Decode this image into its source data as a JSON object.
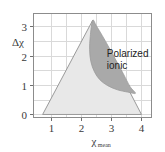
{
  "figure": {
    "background_color": "#ffffff",
    "plot_frame_color": "#8c8c8c",
    "grid_color": "#d9d9d9"
  },
  "chart_data": {
    "type": "area",
    "title": "",
    "subtitle": "",
    "xlabel": "χ",
    "xlabel_subscript": "mean",
    "ylabel": "Δχ",
    "xlim": [
      0.4,
      4.35
    ],
    "ylim": [
      -0.12,
      3.45
    ],
    "xticks": [
      1,
      2,
      3,
      4
    ],
    "xtick_labels": [
      "1",
      "2",
      "3",
      "4"
    ],
    "yticks": [
      0,
      1,
      2,
      3
    ],
    "ytick_labels": [
      "0",
      "1",
      "2",
      "3"
    ],
    "grid": true,
    "grid_x_values": [
      1,
      1.5,
      2,
      2.5,
      3,
      3.5,
      4
    ],
    "grid_y_values": [
      0,
      0.5,
      1,
      1.5,
      2,
      2.5,
      3
    ],
    "legend_position": "none",
    "regions": [
      {
        "name": "main-triangle",
        "label": "",
        "fill_color": "#e8e8e8",
        "edge_color": "#9a9a9a",
        "vertices": [
          [
            0.72,
            0.0
          ],
          [
            2.38,
            3.2
          ],
          [
            4.0,
            0.0
          ]
        ]
      },
      {
        "name": "polarized-ionic",
        "label": "Polarized ionic",
        "label_line1": "Polarized",
        "label_line2": "ionic",
        "label_x": 2.85,
        "label_y": 2.0,
        "fill_color": "#a9a9a9",
        "edge_color": "#9a9a9a",
        "outline_points": [
          [
            2.38,
            3.2
          ],
          [
            2.3,
            2.65
          ],
          [
            2.28,
            2.2
          ],
          [
            2.32,
            1.8
          ],
          [
            2.44,
            1.45
          ],
          [
            2.62,
            1.18
          ],
          [
            2.88,
            0.98
          ],
          [
            3.2,
            0.84
          ],
          [
            3.55,
            0.76
          ],
          [
            3.8,
            0.72
          ],
          [
            3.62,
            0.95
          ],
          [
            3.4,
            1.38
          ],
          [
            3.15,
            1.85
          ],
          [
            2.92,
            2.28
          ],
          [
            2.7,
            2.68
          ],
          [
            2.5,
            3.02
          ]
        ]
      }
    ]
  }
}
